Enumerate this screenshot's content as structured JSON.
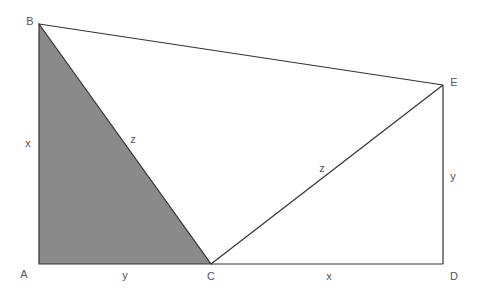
{
  "diagram": {
    "colors": {
      "shade": "#8a8a8a",
      "stroke": "#333333",
      "label": "#555555"
    },
    "points": {
      "A": {
        "label": "A",
        "x": 39,
        "y": 264
      },
      "B": {
        "label": "B",
        "x": 39,
        "y": 24
      },
      "C": {
        "label": "C",
        "x": 211,
        "y": 264
      },
      "D": {
        "label": "D",
        "x": 443,
        "y": 264
      },
      "E": {
        "label": "E",
        "x": 443,
        "y": 85
      }
    },
    "edge_labels": {
      "AB": "x",
      "BC": "z",
      "AC": "y",
      "CE": "z",
      "DE": "y",
      "CD": "x"
    },
    "shaded_triangle": "ABC"
  }
}
